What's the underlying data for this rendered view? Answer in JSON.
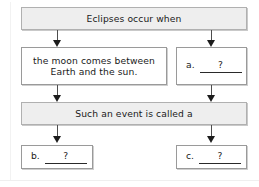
{
  "diagram": {
    "type": "flowchart",
    "title": "Eclipses occur when",
    "nodes": [
      {
        "id": "top",
        "data_name": "node-eclipses-occur-when",
        "text": "Eclipses occur when",
        "style": "shaded"
      },
      {
        "id": "mid-left",
        "data_name": "node-moon-between-earth-sun",
        "text": "the moon comes between\nEarth and the sun.",
        "style": "plain"
      },
      {
        "id": "mid-right",
        "data_name": "node-blank-a",
        "label": "a.",
        "blank": "?",
        "style": "plain"
      },
      {
        "id": "middle",
        "data_name": "node-such-an-event",
        "text": "Such an event is called a",
        "style": "shaded"
      },
      {
        "id": "bottom-left",
        "data_name": "node-blank-b",
        "label": "b.",
        "blank": "?",
        "style": "plain"
      },
      {
        "id": "bottom-right",
        "data_name": "node-blank-c",
        "label": "c.",
        "blank": "?",
        "style": "plain"
      }
    ],
    "edges": [
      {
        "from": "top",
        "to": "mid-left",
        "data_name": "arrow-top-to-mid-left"
      },
      {
        "from": "top",
        "to": "mid-right",
        "data_name": "arrow-top-to-mid-right"
      },
      {
        "from": "mid-left",
        "to": "middle",
        "data_name": "arrow-mid-left-to-middle"
      },
      {
        "from": "mid-right",
        "to": "middle",
        "data_name": "arrow-mid-right-to-middle"
      },
      {
        "from": "middle",
        "to": "bottom-left",
        "data_name": "arrow-middle-to-bottom-left"
      },
      {
        "from": "middle",
        "to": "bottom-right",
        "data_name": "arrow-middle-to-bottom-right"
      }
    ],
    "colors": {
      "shaded_fill": "#eeeeee",
      "box_border": "#a8a8a8",
      "arrow": "#1c1c1c",
      "text": "#1a1a1a"
    }
  }
}
